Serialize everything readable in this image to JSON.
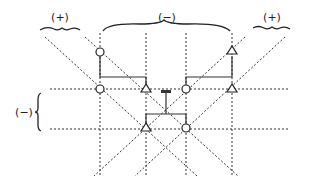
{
  "diagram": {
    "labels": {
      "top_left": "(+)",
      "top_middle": "(−)",
      "top_right": "(+)",
      "left_side": "(−)"
    },
    "markers": {
      "circle_count": 4,
      "triangle_count": 4
    },
    "icons": {
      "circle": "circle-marker",
      "triangle": "triangle-marker",
      "resistor": "capacitor-symbol"
    }
  }
}
